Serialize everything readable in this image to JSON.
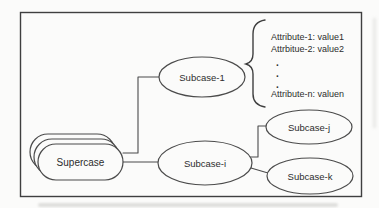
{
  "figure": {
    "nodes": {
      "supercase": "Supercase",
      "subcase_1": "Subcase-1",
      "subcase_i": "Subcase-i",
      "subcase_j": "Subcase-j",
      "subcase_k": "Subcase-k"
    },
    "attributes": {
      "line_1": "Attribute-1: value1",
      "line_2": "Attrbitue-2: value2",
      "line_n": "Attribute-n: valuen",
      "dot": "."
    },
    "colors": {
      "stroke": "#4b4b4b",
      "text": "#2d2d2d",
      "paper": "#fbfbfa"
    }
  }
}
